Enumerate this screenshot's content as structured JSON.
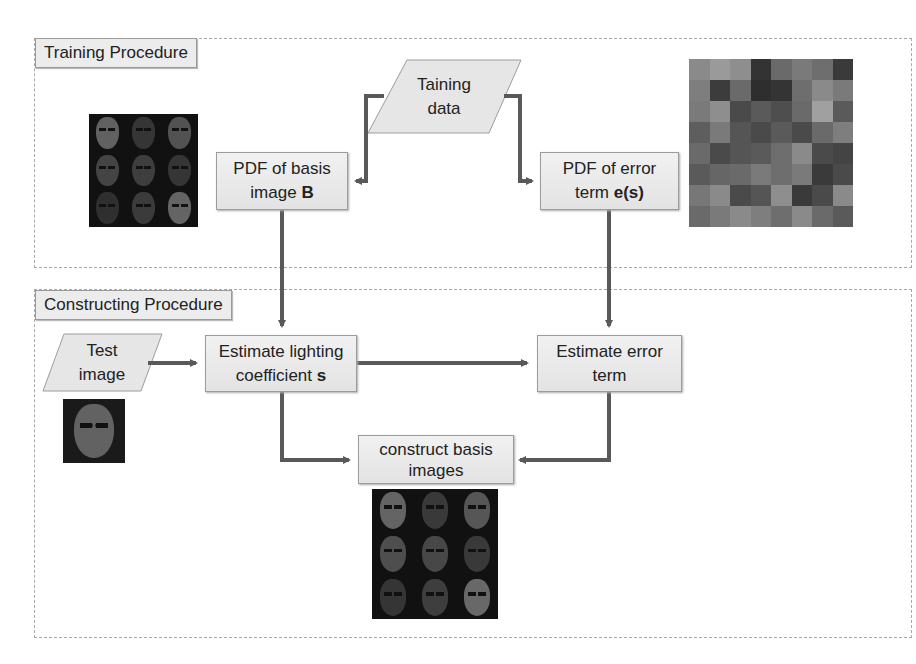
{
  "training": {
    "label": "Training Procedure",
    "input": {
      "line1": "Taining",
      "line2": "data"
    },
    "pdf_basis": {
      "line1": "PDF of basis",
      "line2_plain": "image ",
      "line2_bold": "B"
    },
    "pdf_error": {
      "line1": "PDF of error",
      "line2_plain": "term ",
      "line2_bold": "e(s)"
    },
    "left_image": "basis-images-3x3-grid",
    "right_image": "error-term-images-8x8-grid"
  },
  "constructing": {
    "label": "Constructing Procedure",
    "input": {
      "line1": "Test",
      "line2": "image"
    },
    "estimate_lighting": {
      "line1": "Estimate lighting",
      "line2_plain": "coefficient ",
      "line2_bold": "s"
    },
    "estimate_error": {
      "line1": "Estimate error",
      "line2": "term"
    },
    "construct": {
      "line1": "construct basis",
      "line2": "images"
    },
    "test_image": "test-face-image",
    "output_image": "constructed-basis-images-3x3-grid"
  },
  "colors": {
    "arrow": "#595959",
    "box_fill": "#e8e8e8",
    "box_border": "#9c9c9c",
    "region_border": "#a8a8a8"
  }
}
